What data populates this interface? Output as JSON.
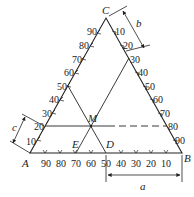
{
  "diagram": {
    "type": "ternary-phase-diagram",
    "vertices": {
      "A": "A",
      "B": "B",
      "C": "C"
    },
    "points": {
      "M": "M",
      "D": "D",
      "E": "E"
    },
    "dimension_labels": {
      "a": "a",
      "b": "b",
      "c": "c"
    },
    "ticks_AB": [
      "90",
      "80",
      "70",
      "60",
      "50",
      "40",
      "30",
      "20",
      "10"
    ],
    "ticks_AC": [
      "10",
      "20",
      "30",
      "40",
      "50",
      "60",
      "70",
      "80",
      "90"
    ],
    "ticks_BC": [
      "10",
      "20",
      "30",
      "40",
      "50",
      "60",
      "70",
      "80",
      "90"
    ],
    "line_color": "#222222"
  }
}
